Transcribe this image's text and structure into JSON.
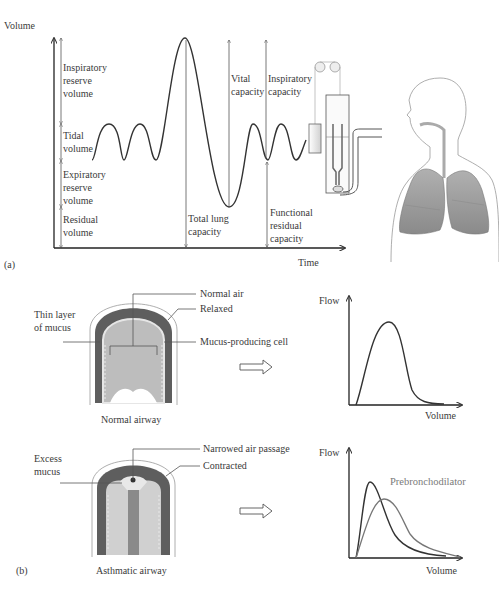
{
  "panel_a": {
    "label": "(a)",
    "y_axis_label": "Volume",
    "x_axis_label": "Time",
    "volumes": {
      "irv": [
        "Inspiratory",
        "reserve",
        "volume"
      ],
      "tidal": [
        "Tidal",
        "volume"
      ],
      "erv": [
        "Expiratory",
        "reserve",
        "volume"
      ],
      "residual": [
        "Residual",
        "volume"
      ]
    },
    "capacities": {
      "total_lung": [
        "Total lung",
        "capacity"
      ],
      "vital": [
        "Vital",
        "capacity"
      ],
      "inspiratory": [
        "Inspiratory",
        "capacity"
      ],
      "frc": [
        "Functional",
        "residual",
        "capacity"
      ]
    },
    "illustration": "spirometer-and-human-lungs"
  },
  "panel_b": {
    "label": "(b)",
    "normal": {
      "caption": "Normal airway",
      "callouts": {
        "normal_air": "Normal air",
        "thin_mucus": [
          "Thin layer",
          "of mucus"
        ],
        "relaxed": "Relaxed",
        "mucus_cell": "Mucus-producing cell"
      },
      "flow_chart": {
        "ylabel": "Flow",
        "xlabel": "Volume"
      }
    },
    "asthmatic": {
      "caption": "Asthmatic airway",
      "callouts": {
        "narrowed": "Narrowed air passage",
        "excess_mucus": [
          "Excess",
          "mucus"
        ],
        "contracted": "Contracted"
      },
      "flow_chart": {
        "ylabel": "Flow",
        "xlabel": "Volume",
        "series_label": "Prebronchodilator"
      }
    },
    "arrow_icon": "hollow-right-arrow"
  },
  "colors": {
    "line": "#333333",
    "grey_curve": "#777777",
    "lung_fill": "#9a9a9a",
    "airway_wall": "#5e5e5e",
    "airway_lumen": "#b8b8b8"
  }
}
